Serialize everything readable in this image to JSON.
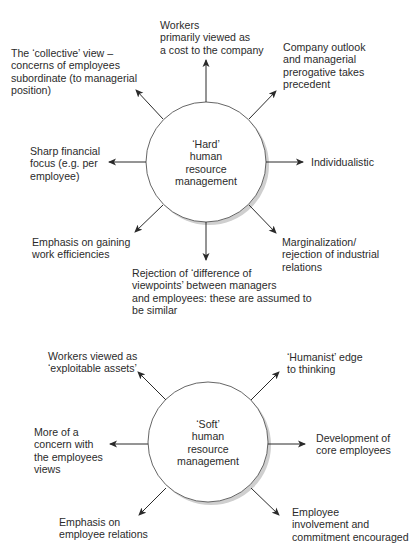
{
  "hard": {
    "center_label": [
      "‘Hard’",
      "human",
      "resource",
      "management"
    ],
    "items": {
      "top": [
        "Workers",
        "primarily viewed as",
        "a cost to the company"
      ],
      "top_right": [
        "Company outlook",
        "and managerial",
        "prerogative takes",
        "precedent"
      ],
      "right": [
        "Individualistic"
      ],
      "bottom_right": [
        "Marginalization/",
        "rejection of industrial",
        "relations"
      ],
      "bottom": [
        "Rejection of ‘difference of",
        "viewpoints’ between managers",
        "and employees: these are assumed to",
        "be similar"
      ],
      "bottom_left": [
        "Emphasis on gaining",
        "work efficiencies"
      ],
      "left": [
        "Sharp financial",
        "focus (e.g. per",
        "employee)"
      ],
      "top_left": [
        "The ‘collective’ view –",
        "concerns of employees",
        "subordinate (to managerial",
        "position)"
      ]
    }
  },
  "soft": {
    "center_label": [
      "‘Soft’",
      "human",
      "resource",
      "management"
    ],
    "items": {
      "top_left": [
        "Workers viewed as",
        "‘exploitable assets’"
      ],
      "top_right": [
        "‘Humanist’ edge",
        "to thinking"
      ],
      "left": [
        "More of a",
        "concern with",
        "the employees",
        "views"
      ],
      "right": [
        "Development of",
        "core employees"
      ],
      "bottom_left": [
        "Emphasis on",
        "employee relations"
      ],
      "bottom_right": [
        "Employee",
        "involvement and",
        "commitment encouraged"
      ]
    }
  },
  "colors": {
    "line": "#2a2a2a",
    "shadow": "#c8c8c8",
    "text": "#2b2b2b"
  }
}
